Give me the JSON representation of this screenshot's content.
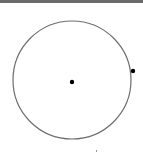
{
  "diagram": {
    "type": "circle-with-points",
    "circle": {
      "cx": 72,
      "cy": 80,
      "r": 59,
      "stroke": "#6e6e6e",
      "stroke_width": 1.2
    },
    "points": [
      {
        "name": "center",
        "x": 72,
        "y": 82,
        "r": 2.2,
        "color": "#000000"
      },
      {
        "name": "edge",
        "x": 133,
        "y": 71,
        "r": 2.2,
        "color": "#000000"
      }
    ],
    "marks": [
      {
        "name": "tick-mark",
        "x": 96,
        "y": 150
      }
    ]
  },
  "topbar": {
    "color": "#6b6b6b"
  }
}
